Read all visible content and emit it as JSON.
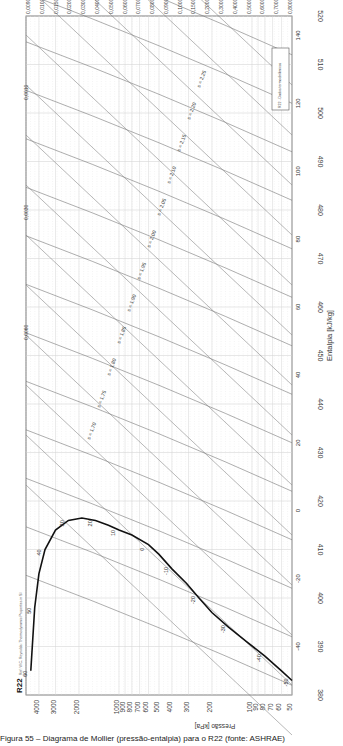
{
  "chart_data": {
    "type": "line",
    "title": "R22",
    "subtitle": "Ref: W.C. Reynolds: Thermodynamic Properties in SI",
    "orientation": "rotated-90",
    "xlabel": "Entalpia [kJ/kg]",
    "ylabel": "Pressão [kPa]",
    "x_axis": {
      "label": "Entalpia [kJ/kg]",
      "ticks": [
        380,
        390,
        400,
        410,
        420,
        430,
        440,
        450,
        460,
        470,
        480,
        490,
        500,
        510,
        520
      ],
      "range": [
        380,
        520
      ],
      "scale": "linear"
    },
    "y_axis": {
      "label": "Pressão [kPa]",
      "ticks": [
        50,
        60,
        70,
        80,
        90,
        100,
        200,
        300,
        400,
        500,
        600,
        700,
        800,
        900,
        1000,
        2000,
        3000,
        4000
      ],
      "range": [
        50,
        5000
      ],
      "scale": "log"
    },
    "specific_volume_labels": [
      "0,0090",
      "0,0100",
      "0,0150",
      "0,0200",
      "0,0300",
      "0,0400",
      "0,0500",
      "0,0600",
      "0,0700",
      "0,0800",
      "0,0900",
      "0,1000",
      "0,1500",
      "0,2000",
      "0,3000",
      "0,4000",
      "0,5000",
      "0,6000",
      "0,7000",
      "0,8000"
    ],
    "isotherm_labels_vapor": [
      -50,
      -40,
      -30,
      -20,
      -10,
      0,
      10,
      20,
      30,
      40,
      50,
      60
    ],
    "isotherm_labels_superheat": [
      -40,
      -20,
      0,
      20,
      40,
      60,
      80,
      100,
      120,
      140
    ],
    "isentrope_labels": [
      "s = 1,70",
      "s = 1,75",
      "s = 1,80",
      "s = 1,85",
      "s = 1,90",
      "s = 1,95",
      "s = 2,00",
      "s = 2,05",
      "s = 2,10",
      "s = 2,15",
      "s = 2,20",
      "s = 2,25"
    ],
    "inline_volume_labels": [
      "0,0010",
      "0,0030",
      "0,0060"
    ],
    "saturation_curve": {
      "points_h_p": [
        [
          383,
          50
        ],
        [
          385,
          60
        ],
        [
          388,
          80
        ],
        [
          391,
          110
        ],
        [
          394,
          150
        ],
        [
          397,
          200
        ],
        [
          400,
          250
        ],
        [
          403,
          310
        ],
        [
          406,
          400
        ],
        [
          409,
          500
        ],
        [
          411,
          600
        ],
        [
          413,
          800
        ],
        [
          414,
          1000
        ],
        [
          415,
          1200
        ],
        [
          416,
          1500
        ],
        [
          416.5,
          1900
        ],
        [
          416,
          2400
        ],
        [
          414,
          3000
        ],
        [
          410,
          3600
        ],
        [
          405,
          4000
        ],
        [
          398,
          4300
        ],
        [
          385,
          4600
        ]
      ]
    },
    "legend": "R22: diagrama pressão-entalpia",
    "grid": true
  },
  "labels": {
    "refrigerant": "R22",
    "x_title": "Entalpia [kJ/kg]",
    "y_title": "Pressão [kPa]",
    "legend_box": "R22 - Dados termodinâmicos",
    "caption": "Figura 55 – Diagrama de Mollier (pressão-entalpia) para o R22 (fonte: ASHRAE)"
  }
}
